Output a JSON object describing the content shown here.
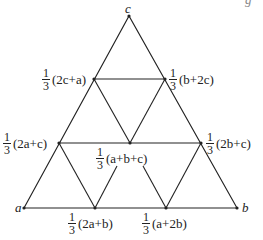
{
  "diagram": {
    "type": "triangle-subdivision",
    "stroke_color": "#222222",
    "background": "#ffffff",
    "points": {
      "a": {
        "x": 24,
        "y": 208
      },
      "b": {
        "x": 237,
        "y": 208
      },
      "c": {
        "x": 129,
        "y": 16
      },
      "p2ca": {
        "x": 94,
        "y": 79
      },
      "pb2c": {
        "x": 165,
        "y": 79
      },
      "p2ac": {
        "x": 59,
        "y": 143
      },
      "p2bc": {
        "x": 201,
        "y": 143
      },
      "center": {
        "x": 130,
        "y": 143
      },
      "p2ab": {
        "x": 95,
        "y": 208
      },
      "pa2b": {
        "x": 166,
        "y": 208
      }
    },
    "labels": {
      "a": "a",
      "b": "b",
      "c": "c",
      "frac_num": "1",
      "frac_den": "3",
      "p2ca": "(2c+a)",
      "pb2c": "(b+2c)",
      "p2ac": "(2a+c)",
      "p2bc": "(2b+c)",
      "center": "(a+b+c)",
      "p2ab": "(2a+b)",
      "pa2b": "(a+2b)",
      "corner_fragment": "g"
    }
  }
}
